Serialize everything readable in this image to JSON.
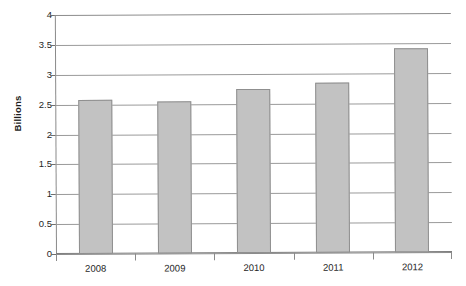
{
  "chart_data": {
    "type": "bar",
    "title": "",
    "subtitle": "",
    "xlabel": "",
    "ylabel": "Billions",
    "categories": [
      "2008",
      "2009",
      "2010",
      "2011",
      "2012"
    ],
    "values": [
      2.57,
      2.55,
      2.74,
      2.85,
      3.42
    ],
    "series": [
      {
        "name": "Billions",
        "values": [
          2.57,
          2.55,
          2.74,
          2.85,
          3.42
        ]
      }
    ],
    "ylim": [
      0,
      4
    ],
    "ytick_step": 0.5,
    "yticks": [
      "4",
      "3.5",
      "3",
      "2.5",
      "2",
      "1.5",
      "1",
      "0.5",
      "0"
    ],
    "ytick_values": [
      4,
      3.5,
      3,
      2.5,
      2,
      1.5,
      1,
      0.5,
      0
    ],
    "grid": true,
    "grid_axis": "y",
    "legend": false,
    "legend_position": "none",
    "bar_color": "#c2c2c2",
    "bar_border_color": "#8f8f8f",
    "grid_color": "#9a9a9a",
    "axis_color": "#8a8a8a",
    "background_color": "#ffffff",
    "text_color": "#262626"
  },
  "axis": {
    "y_title": "Billions"
  },
  "caption": {
    "partial_text": ""
  }
}
